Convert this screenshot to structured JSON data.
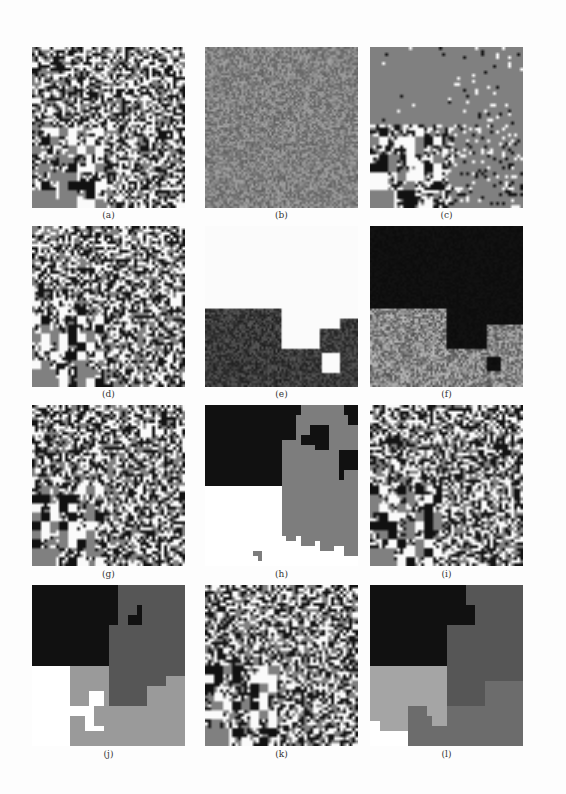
{
  "figure": {
    "panels": [
      {
        "id": "a",
        "caption": "(a)",
        "type": "noise-with-lower-left-blocks",
        "description": "fine salt-and-pepper noise; blocky black/white patches in lower-left"
      },
      {
        "id": "b",
        "caption": "(b)",
        "type": "gray-noise",
        "description": "mid-gray fine noise, slightly blotchy lower half"
      },
      {
        "id": "c",
        "caption": "(c)",
        "type": "gray-with-scattered-pixels",
        "description": "flat gray top with sparse black/white specks; blocky noise lower-left"
      },
      {
        "id": "d",
        "caption": "(d)",
        "type": "noise-with-lower-left-blocks",
        "description": "similar to (a)"
      },
      {
        "id": "e",
        "caption": "(e)",
        "type": "white-with-dark-textured-region",
        "description": "white upper area; dark textured region lower portion with step contour"
      },
      {
        "id": "f",
        "caption": "(f)",
        "type": "black-top-textured-bottom",
        "description": "black top region; gray textured lower-left region"
      },
      {
        "id": "g",
        "caption": "(g)",
        "type": "noise-with-lower-left-blocks",
        "description": "similar to (a)"
      },
      {
        "id": "h",
        "caption": "(h)",
        "type": "segmentation-3-class",
        "description": "black top-left, gray right, white bottom-left"
      },
      {
        "id": "i",
        "caption": "(i)",
        "type": "noise-with-lower-left-blocks",
        "description": "similar to (a)"
      },
      {
        "id": "j",
        "caption": "(j)",
        "type": "segmentation-4-class",
        "description": "black top-left, dark gray right, light gray bottom, white notch"
      },
      {
        "id": "k",
        "caption": "(k)",
        "type": "noise-with-lower-left-blocks",
        "description": "similar to (a)"
      },
      {
        "id": "l",
        "caption": "(l)",
        "type": "segmentation-4-class",
        "description": "black top-left, dark gray right, light gray left-middle, white bottom-left"
      }
    ],
    "colors": {
      "background": "#fdfdfd",
      "black": "#111111",
      "dark_gray": "#555555",
      "mid_gray": "#7a7a7a",
      "light_gray": "#a5a5a5",
      "white": "#ffffff"
    }
  }
}
